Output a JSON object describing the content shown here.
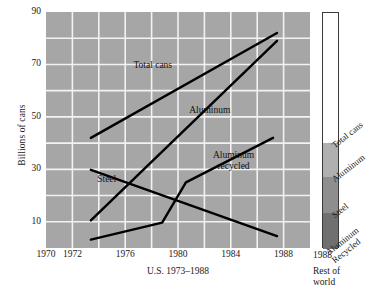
{
  "chart_data": {
    "type": "line",
    "title": "",
    "xlabel": "U.S. 1973–1988",
    "ylabel": "Billions of cans",
    "xlim": [
      1970,
      1990
    ],
    "ylim": [
      0,
      90
    ],
    "grid": true,
    "x_ticks": [
      {
        "value": 1970,
        "label": "1970"
      },
      {
        "value": 1972,
        "label": "1972"
      },
      {
        "value": 1976,
        "label": "1976"
      },
      {
        "value": 1980,
        "label": "1980"
      },
      {
        "value": 1984,
        "label": "1984"
      },
      {
        "value": 1988,
        "label": "1988"
      }
    ],
    "x_gridlines": [
      1972,
      1974,
      1976,
      1978,
      1980,
      1982,
      1984,
      1986,
      1988
    ],
    "y_ticks": [
      {
        "value": 10,
        "label": "10"
      },
      {
        "value": 30,
        "label": "30"
      },
      {
        "value": 50,
        "label": "50"
      },
      {
        "value": 70,
        "label": "70"
      },
      {
        "value": 90,
        "label": "90"
      }
    ],
    "y_gridlines": [
      10,
      20,
      30,
      40,
      50,
      60,
      70,
      80
    ],
    "plot_background": "#a6a6a6",
    "gridline_color": "#f2f2f2",
    "line_color": "#000000",
    "series": [
      {
        "name": "Total cans",
        "label": "Total cans",
        "label_x": 1978.1,
        "label_y": 69.5,
        "points": [
          {
            "x": 1973.4,
            "y": 42.0
          },
          {
            "x": 1987.5,
            "y": 82.0
          }
        ]
      },
      {
        "name": "Aluminum",
        "label": "Aluminum",
        "label_x": 1982.4,
        "label_y": 52.5,
        "points": [
          {
            "x": 1973.4,
            "y": 10.5
          },
          {
            "x": 1987.5,
            "y": 79.0
          }
        ]
      },
      {
        "name": "Aluminum recycled",
        "label": "Aluminum\nrecycled",
        "label_x": 1984.2,
        "label_y": 33.0,
        "points": [
          {
            "x": 1973.4,
            "y": 3.2
          },
          {
            "x": 1978.8,
            "y": 9.7
          },
          {
            "x": 1980.6,
            "y": 25.0
          },
          {
            "x": 1987.2,
            "y": 42.0
          }
        ]
      },
      {
        "name": "Steel",
        "label": "Steel",
        "label_x": 1974.6,
        "label_y": 26.0,
        "points": [
          {
            "x": 1973.4,
            "y": 29.8
          },
          {
            "x": 1987.5,
            "y": 4.5
          }
        ]
      }
    ],
    "legend_bar": {
      "axis_label": "1988",
      "caption_lines": [
        "Rest of",
        "world"
      ],
      "segments": [
        {
          "name": "Total cans",
          "label": "Total cans",
          "color": "#ffffff",
          "fraction": 0.552
        },
        {
          "name": "Aluminum",
          "label": "Aluminum",
          "color": "#b0b0b0",
          "fraction": 0.145
        },
        {
          "name": "Steel",
          "label": "Steel",
          "color": "#8e8e8e",
          "fraction": 0.15
        },
        {
          "name": "Aluminum Recycled",
          "label": "Aluminum\nRecycled",
          "color": "#707070",
          "fraction": 0.153
        }
      ]
    }
  },
  "bottom_caption": ""
}
